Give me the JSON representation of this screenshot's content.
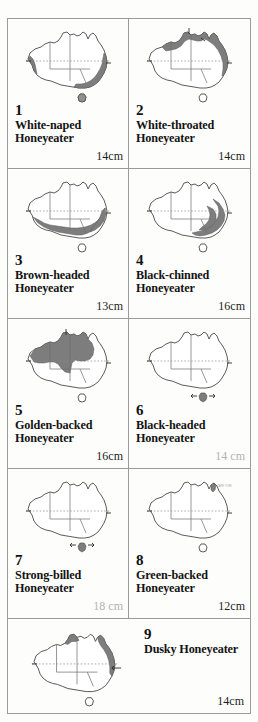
{
  "page": {
    "layout": "grid-2-column",
    "shading_color": "#7d7d7d",
    "coast_color": "#4a4a4a",
    "background": "#fdfdfc"
  },
  "entries": [
    {
      "number": "1",
      "name_line1": "White-naped",
      "name_line2": "Honeyeater",
      "size": "14cm",
      "size_faded": false,
      "map_region": "eastern-and-southwestern-coastal"
    },
    {
      "number": "2",
      "name_line1": "White-throated",
      "name_line2": "Honeyeater",
      "size": "14cm",
      "size_faded": false,
      "map_region": "northern-and-eastern-coastal"
    },
    {
      "number": "3",
      "name_line1": "Brown-headed",
      "name_line2": "Honeyeater",
      "size": "13cm",
      "size_faded": false,
      "map_region": "southern-and-southeastern"
    },
    {
      "number": "4",
      "name_line1": "Black-chinned",
      "name_line2": "Honeyeater",
      "size": "16cm",
      "size_faded": false,
      "map_region": "eastern-inland"
    },
    {
      "number": "5",
      "name_line1": "Golden-backed",
      "name_line2": "Honeyeater",
      "size": "16cm",
      "size_faded": false,
      "map_region": "northern-tropical"
    },
    {
      "number": "6",
      "name_line1": "Black-headed",
      "name_line2": "Honeyeater",
      "size": "14 cm",
      "size_faded": true,
      "map_region": "tasmania-only"
    },
    {
      "number": "7",
      "name_line1": "Strong-billed",
      "name_line2": "Honeyeater",
      "size": "18 cm",
      "size_faded": true,
      "map_region": "tasmania-only"
    },
    {
      "number": "8",
      "name_line1": "Green-backed",
      "name_line2": "Honeyeater",
      "size": "12cm",
      "size_faded": false,
      "map_region": "cape-york-tip"
    },
    {
      "number": "9",
      "name_line1": "Dusky Honeyeater",
      "name_line2": "",
      "size": "14cm",
      "size_faded": false,
      "map_region": "northern-and-northeastern-coastal"
    }
  ],
  "map_annotations": {
    "tropic_line": "tropic-of-capricorn-dashed",
    "cape_york_note": "CAPE YORK PENINSULA"
  }
}
